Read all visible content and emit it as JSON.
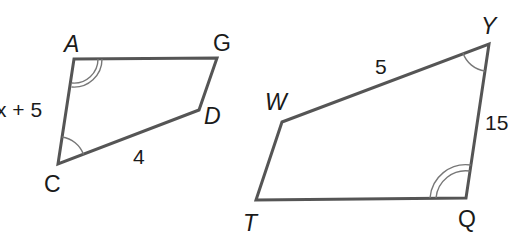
{
  "figure": {
    "colors": {
      "edge": "#555555",
      "arc": "#777777",
      "text": "#1a1a1a",
      "background": "#ffffff"
    }
  },
  "quadrilateral_1": {
    "name": "ACDG",
    "vertices": {
      "A": {
        "label": "A",
        "x": 74,
        "y": 59
      },
      "G": {
        "label": "G",
        "x": 217,
        "y": 58
      },
      "D": {
        "label": "D",
        "x": 199,
        "y": 110
      },
      "C": {
        "label": "C",
        "x": 58,
        "y": 164
      }
    },
    "side_labels": {
      "AC": "x + 5",
      "CD": "4"
    },
    "angle_marks": {
      "A": "double arc",
      "C": "single arc"
    }
  },
  "quadrilateral_2": {
    "name": "TWYQ",
    "vertices": {
      "W": {
        "label": "W",
        "x": 282,
        "y": 122
      },
      "Y": {
        "label": "Y",
        "x": 489,
        "y": 44
      },
      "Q": {
        "label": "Q",
        "x": 466,
        "y": 198
      },
      "T": {
        "label": "T",
        "x": 256,
        "y": 200
      }
    },
    "side_labels": {
      "WY": "5",
      "YQ": "15"
    },
    "angle_marks": {
      "Y": "single arc",
      "Q": "double arc"
    }
  }
}
